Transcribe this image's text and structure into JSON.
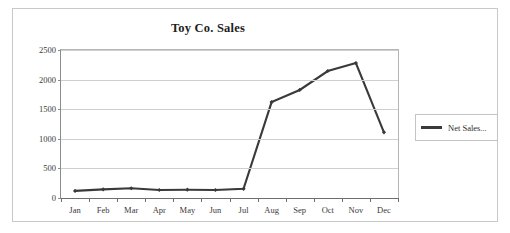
{
  "chart_data": {
    "type": "line",
    "title": "Toy Co. Sales",
    "xlabel": "",
    "ylabel": "",
    "categories": [
      "Jan",
      "Feb",
      "Mar",
      "Apr",
      "May",
      "Jun",
      "Jul",
      "Aug",
      "Sep",
      "Oct",
      "Nov",
      "Dec"
    ],
    "series": [
      {
        "name": "Net Sales...",
        "values": [
          120,
          145,
          165,
          135,
          140,
          135,
          155,
          1620,
          1825,
          2145,
          2280,
          1110
        ],
        "color": "#3a3a3a",
        "marker": "diamond"
      }
    ],
    "ylim": [
      0,
      2500
    ],
    "yticks": [
      0,
      500,
      1000,
      1500,
      2000,
      2500
    ],
    "ytick_labels": [
      "0",
      "500",
      "1000",
      "1500",
      "2000",
      "2500"
    ],
    "grid": true,
    "grid_axis": "y",
    "legend_position": "right",
    "legend_entries": [
      "Net Sales..."
    ]
  },
  "legend": {
    "entry_label": "Net Sales..."
  },
  "colors": {
    "series_line": "#3a3a3a",
    "gridline": "#cfcfcf",
    "axis": "#6e6e6e",
    "frame_border": "#c9c9c9",
    "text": "#2b2b2b"
  }
}
